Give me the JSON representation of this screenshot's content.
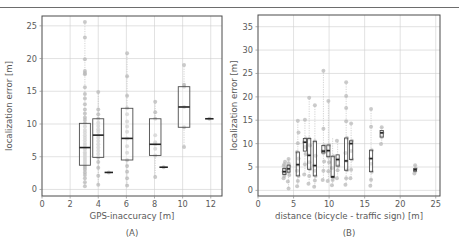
{
  "figure": {
    "background": "#ffffff",
    "top_rule_color": "#6d6d6d",
    "point_color": "#b9b9b9",
    "box_edge_color": "#4d4d4d",
    "median_color": "#222222",
    "grid_color": "#cfcfcf"
  },
  "chart_data": [
    {
      "type": "box",
      "panel_label": "(A)",
      "title": "",
      "xlabel": "GPS-inaccuracy [m]",
      "ylabel": "localization error [m]",
      "xlim": [
        0,
        12.8
      ],
      "ylim": [
        -1.0,
        26.5
      ],
      "xticks": [
        0,
        2,
        4,
        6,
        8,
        10,
        12
      ],
      "xticklabels": [
        "0",
        "2",
        "4",
        "6",
        "8",
        "10",
        "12"
      ],
      "yticks": [
        0,
        5,
        10,
        15,
        20,
        25
      ],
      "yticklabels": [
        "0",
        "5",
        "10",
        "15",
        "20",
        "25"
      ],
      "grid": true,
      "legend": "none",
      "boxes": [
        {
          "x": 3.05,
          "width": 0.78,
          "q1": 3.7,
          "median": 6.4,
          "q3": 10.1,
          "whisker_low": 0.5,
          "whisker_high": 25.6
        },
        {
          "x": 4.0,
          "width": 0.78,
          "q1": 4.9,
          "median": 8.3,
          "q3": 10.8,
          "whisker_low": 0.7,
          "whisker_high": 14.9
        },
        {
          "x": 4.75,
          "width": 0.6,
          "q1": 2.6,
          "median": 2.6,
          "q3": 2.6,
          "whisker_low": 2.6,
          "whisker_high": 2.6
        },
        {
          "x": 6.05,
          "width": 0.82,
          "q1": 4.5,
          "median": 7.8,
          "q3": 12.4,
          "whisker_low": 0.6,
          "whisker_high": 20.8
        },
        {
          "x": 8.05,
          "width": 0.82,
          "q1": 5.2,
          "median": 6.9,
          "q3": 10.8,
          "whisker_low": 1.9,
          "whisker_high": 13.4
        },
        {
          "x": 8.65,
          "width": 0.6,
          "q1": 3.4,
          "median": 3.4,
          "q3": 3.4,
          "whisker_low": 3.4,
          "whisker_high": 3.4
        },
        {
          "x": 10.1,
          "width": 0.82,
          "q1": 9.5,
          "median": 12.6,
          "q3": 15.7,
          "whisker_low": 6.5,
          "whisker_high": 19.0
        },
        {
          "x": 11.9,
          "width": 0.6,
          "q1": 10.8,
          "median": 10.8,
          "q3": 10.8,
          "whisker_low": 10.8,
          "whisker_high": 10.8
        }
      ],
      "scatter": {
        "x": [
          3.05,
          3.05,
          3.05,
          3.05,
          3.05,
          3.05,
          3.05,
          3.05,
          3.05,
          3.05,
          3.05,
          3.05,
          3.05,
          3.05,
          3.05,
          3.05,
          3.05,
          3.05,
          3.05,
          3.05,
          3.05,
          3.05,
          3.05,
          3.05,
          3.05,
          3.05,
          3.05,
          3.05,
          3.05,
          3.05,
          3.05,
          3.05,
          3.05,
          3.05,
          3.05,
          3.05,
          3.05,
          3.05,
          3.05,
          3.05,
          4.0,
          4.0,
          4.0,
          4.0,
          4.0,
          4.0,
          4.0,
          4.0,
          4.0,
          4.0,
          4.0,
          4.0,
          4.0,
          4.0,
          4.0,
          4.0,
          4.0,
          4.0,
          4.0,
          4.0,
          4.75,
          6.05,
          6.05,
          6.05,
          6.05,
          6.05,
          6.05,
          6.05,
          6.05,
          6.05,
          6.05,
          6.05,
          6.05,
          6.05,
          6.05,
          6.05,
          6.05,
          8.05,
          8.05,
          8.05,
          8.05,
          8.05,
          8.05,
          8.05,
          8.05,
          8.05,
          8.65,
          10.1,
          10.1,
          10.1,
          10.1,
          10.1,
          10.1,
          11.9
        ],
        "y": [
          25.6,
          23.2,
          19.9,
          18.1,
          17.8,
          17.6,
          15.6,
          14.6,
          13.9,
          13.0,
          12.2,
          11.6,
          11.0,
          10.6,
          10.1,
          9.6,
          9.1,
          8.7,
          8.3,
          7.9,
          7.5,
          7.1,
          6.8,
          6.4,
          6.1,
          5.7,
          5.4,
          5.1,
          4.8,
          4.5,
          4.2,
          3.9,
          3.6,
          3.3,
          3.0,
          2.6,
          2.2,
          1.7,
          1.1,
          0.5,
          14.9,
          12.2,
          11.5,
          10.8,
          10.2,
          9.7,
          9.2,
          8.8,
          8.3,
          7.9,
          7.4,
          6.9,
          6.4,
          5.9,
          5.4,
          4.9,
          4.2,
          3.3,
          2.1,
          0.7,
          2.6,
          20.8,
          17.3,
          14.3,
          12.4,
          11.5,
          10.4,
          9.6,
          8.8,
          7.8,
          6.6,
          5.6,
          4.5,
          3.6,
          2.7,
          1.7,
          0.6,
          13.4,
          11.8,
          10.8,
          8.3,
          7.2,
          6.9,
          6.2,
          5.2,
          1.9,
          3.4,
          19.0,
          16.0,
          15.7,
          12.6,
          9.5,
          6.5,
          10.8
        ]
      }
    },
    {
      "type": "box",
      "panel_label": "(B)",
      "title": "",
      "xlabel": "distance (bicycle - traffic sign) [m]",
      "ylabel": "localization error [m]",
      "xlim": [
        0,
        25.6
      ],
      "ylim": [
        -1.2,
        37.5
      ],
      "xticks": [
        0,
        5,
        10,
        15,
        20,
        25
      ],
      "xticklabels": [
        "0",
        "5",
        "10",
        "15",
        "20",
        "25"
      ],
      "yticks": [
        0,
        5,
        10,
        15,
        20,
        25,
        30,
        35
      ],
      "yticklabels": [
        "0",
        "5",
        "10",
        "15",
        "20",
        "25",
        "30",
        "35"
      ],
      "grid": true,
      "legend": "none",
      "boxes": [
        {
          "x": 3.7,
          "width": 0.45,
          "q1": 3.4,
          "median": 4.0,
          "q3": 4.7,
          "whisker_low": 2.6,
          "whisker_high": 6.1
        },
        {
          "x": 4.3,
          "width": 0.42,
          "q1": 3.9,
          "median": 4.6,
          "q3": 5.4,
          "whisker_low": 0.4,
          "whisker_high": 6.7
        },
        {
          "x": 5.6,
          "width": 0.45,
          "q1": 3.1,
          "median": 5.5,
          "q3": 8.2,
          "whisker_low": 0.9,
          "whisker_high": 14.9
        },
        {
          "x": 6.6,
          "width": 0.45,
          "q1": 8.4,
          "median": 10.3,
          "q3": 11.1,
          "whisker_low": 3.4,
          "whisker_high": 15.1
        },
        {
          "x": 7.2,
          "width": 0.45,
          "q1": 4.5,
          "median": 7.5,
          "q3": 11.1,
          "whisker_low": 1.4,
          "whisker_high": 19.8
        },
        {
          "x": 8.0,
          "width": 0.45,
          "q1": 3.1,
          "median": 5.3,
          "q3": 10.5,
          "whisker_low": 0.8,
          "whisker_high": 18.2
        },
        {
          "x": 9.2,
          "width": 0.45,
          "q1": 8.0,
          "median": 8.4,
          "q3": 9.6,
          "whisker_low": 2.2,
          "whisker_high": 25.6
        },
        {
          "x": 9.9,
          "width": 0.45,
          "q1": 7.2,
          "median": 8.5,
          "q3": 9.7,
          "whisker_low": 2.0,
          "whisker_high": 19.1
        },
        {
          "x": 10.5,
          "width": 0.45,
          "q1": 2.8,
          "median": 2.9,
          "q3": 7.3,
          "whisker_low": 1.1,
          "whisker_high": 11.3
        },
        {
          "x": 11.2,
          "width": 0.45,
          "q1": 5.2,
          "median": 6.6,
          "q3": 7.6,
          "whisker_low": 2.6,
          "whisker_high": 10.6
        },
        {
          "x": 12.4,
          "width": 0.45,
          "q1": 4.3,
          "median": 6.3,
          "q3": 11.2,
          "whisker_low": 1.2,
          "whisker_high": 23.1
        },
        {
          "x": 13.1,
          "width": 0.45,
          "q1": 6.6,
          "median": 10.0,
          "q3": 10.6,
          "whisker_low": 2.6,
          "whisker_high": 14.3
        },
        {
          "x": 15.9,
          "width": 0.45,
          "q1": 4.0,
          "median": 6.8,
          "q3": 8.6,
          "whisker_low": 1.0,
          "whisker_high": 17.4
        },
        {
          "x": 17.4,
          "width": 0.45,
          "q1": 11.4,
          "median": 12.3,
          "q3": 12.8,
          "whisker_low": 9.9,
          "whisker_high": 13.5
        },
        {
          "x": 22.1,
          "width": 0.4,
          "q1": 4.1,
          "median": 4.4,
          "q3": 4.7,
          "whisker_low": 3.6,
          "whisker_high": 5.4
        }
      ],
      "scatter": {
        "x": [
          3.6,
          3.7,
          3.8,
          3.6,
          3.7,
          3.8,
          3.6,
          3.7,
          3.8,
          3.7,
          4.3,
          4.2,
          4.4,
          4.3,
          4.2,
          4.4,
          4.3,
          4.3,
          5.5,
          5.6,
          5.7,
          5.5,
          5.6,
          5.7,
          5.5,
          5.6,
          5.7,
          5.6,
          5.6,
          6.5,
          6.6,
          6.7,
          6.6,
          6.5,
          6.7,
          6.6,
          7.1,
          7.2,
          7.3,
          7.2,
          7.1,
          7.3,
          7.2,
          7.2,
          7.9,
          8.0,
          8.1,
          8.0,
          7.9,
          8.1,
          8.0,
          8.0,
          9.1,
          9.2,
          9.3,
          9.2,
          9.1,
          9.3,
          9.2,
          9.2,
          9.8,
          9.9,
          10.0,
          9.9,
          9.8,
          10.0,
          9.9,
          10.4,
          10.5,
          10.6,
          10.5,
          10.4,
          10.6,
          11.1,
          11.2,
          11.3,
          11.2,
          11.1,
          12.3,
          12.4,
          12.5,
          12.4,
          12.3,
          12.5,
          12.4,
          12.4,
          12.4,
          12.4,
          13.0,
          13.1,
          13.2,
          13.1,
          13.0,
          13.2,
          13.1,
          15.8,
          15.9,
          16.0,
          15.9,
          15.8,
          16.0,
          15.9,
          15.9,
          17.3,
          17.4,
          17.5,
          17.4,
          22.0,
          22.1,
          22.2,
          22.1
        ],
        "y": [
          2.6,
          3.1,
          3.6,
          4.0,
          4.3,
          4.8,
          5.2,
          5.6,
          6.1,
          4.0,
          0.4,
          1.9,
          3.3,
          4.0,
          4.6,
          5.2,
          5.8,
          6.7,
          0.9,
          2.0,
          3.1,
          4.2,
          5.5,
          6.8,
          8.2,
          10.1,
          12.4,
          14.9,
          5.5,
          3.4,
          5.6,
          7.8,
          9.3,
          10.3,
          11.1,
          15.1,
          1.4,
          3.1,
          4.5,
          6.0,
          7.5,
          9.6,
          11.1,
          19.8,
          0.8,
          2.1,
          3.1,
          4.2,
          5.3,
          7.4,
          10.5,
          18.2,
          2.2,
          4.2,
          6.2,
          8.0,
          8.4,
          9.6,
          13.2,
          25.6,
          2.0,
          4.1,
          6.0,
          7.2,
          8.5,
          9.7,
          19.1,
          1.1,
          2.2,
          2.8,
          2.9,
          4.8,
          7.3,
          2.6,
          4.3,
          5.2,
          6.6,
          10.6,
          1.2,
          2.6,
          4.3,
          6.3,
          8.0,
          11.2,
          17.6,
          20.2,
          23.1,
          14.8,
          2.6,
          4.4,
          6.6,
          8.4,
          10.0,
          10.6,
          14.3,
          1.0,
          2.3,
          4.0,
          5.7,
          6.8,
          8.6,
          13.6,
          17.4,
          9.9,
          11.4,
          12.3,
          13.5,
          3.6,
          4.1,
          4.7,
          5.4
        ]
      }
    }
  ]
}
